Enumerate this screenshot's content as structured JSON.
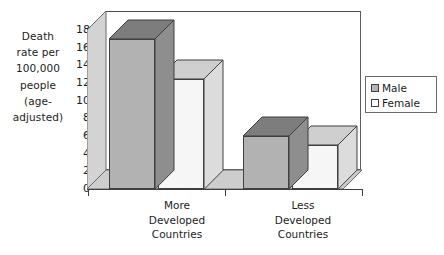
{
  "chart_data": {
    "type": "bar",
    "title": "",
    "subtitle": "",
    "xlabel": "",
    "ylabel": "Death rate per 100,000 people (age-adjusted)",
    "ylabel_lines": [
      "Death",
      "rate per",
      "100,000",
      "people",
      "(age-",
      "adjusted)"
    ],
    "categories": [
      "More Developed Countries",
      "Less Developed Countries"
    ],
    "category_lines": [
      [
        "More",
        "Developed",
        "Countries"
      ],
      [
        "Less",
        "Developed",
        "Countries"
      ]
    ],
    "series": [
      {
        "name": "Male",
        "values": [
          17,
          6
        ],
        "color": "#b2b2b2"
      },
      {
        "name": "Female",
        "values": [
          12.5,
          5
        ],
        "color": "#f4f4f4"
      }
    ],
    "ylim": [
      0,
      18
    ],
    "y_ticks": [
      0,
      2,
      4,
      6,
      8,
      10,
      12,
      14,
      16,
      18
    ],
    "y_tick_labels": [
      "0",
      "2",
      "4",
      "6",
      "8",
      "10",
      "12",
      "14",
      "16",
      "18"
    ],
    "grid": false,
    "legend_position": "right",
    "legend_entries": [
      {
        "label": "Male",
        "swatch": "#b2b2b2"
      },
      {
        "label": "Female",
        "swatch": "#ffffff"
      }
    ],
    "style": "3d-column",
    "colors": {
      "male_front": "#b2b2b2",
      "male_top": "#7d7d7d",
      "male_side": "#8e8e8e",
      "female_front": "#f6f6f6",
      "female_top": "#cfcfcf",
      "female_side": "#dcdcdc",
      "wall": "#ffffff",
      "floor": "#cdcdcd",
      "left_wall": "#d3d3d3",
      "outline": "#3f3f3f",
      "text": "#1c1c1c"
    }
  }
}
